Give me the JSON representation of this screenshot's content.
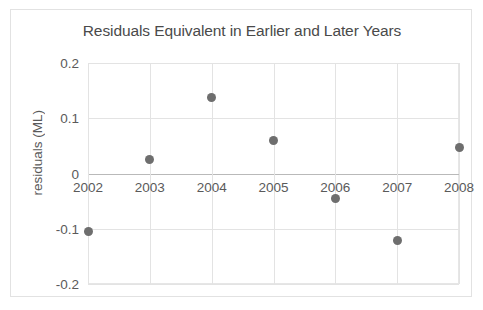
{
  "chart_data": {
    "type": "scatter",
    "title": "Residuals Equivalent in Earlier and Later Years",
    "xlabel": "",
    "ylabel": "residuals (ML)",
    "x": [
      2002,
      2003,
      2004,
      2005,
      2006,
      2007,
      2008
    ],
    "values": [
      -0.105,
      0.025,
      0.137,
      0.06,
      -0.045,
      -0.122,
      0.047
    ],
    "categories": [
      "2002",
      "2003",
      "2004",
      "2005",
      "2006",
      "2007",
      "2008"
    ],
    "xtick_labels": [
      "2002",
      "2003",
      "2004",
      "2005",
      "2006",
      "2007",
      "2008"
    ],
    "ytick_labels": [
      "0.2",
      "0.1",
      "0",
      "-0.1",
      "-0.2"
    ],
    "ytick_values": [
      0.2,
      0.1,
      0,
      -0.1,
      -0.2
    ],
    "ylim": [
      -0.2,
      0.2
    ],
    "xlim": [
      2002,
      2008
    ],
    "grid": true,
    "legend": false,
    "legend_position": "none",
    "marker_color": "#6e6e6e",
    "gridline_color": "#e3e3e3",
    "zero_line_color": "#b9b9b9",
    "text_color": "#5a5a5a",
    "background_color": "#ffffff",
    "border_color": "#e2e2e2",
    "xaxis_label_position": "low"
  }
}
